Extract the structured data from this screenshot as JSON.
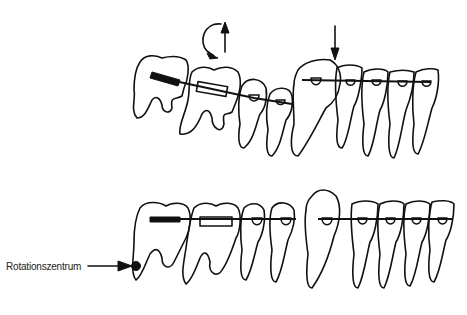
{
  "diagram": {
    "title": "",
    "panels": [
      {
        "id": "top",
        "description": "Lower dental arch with brackets and archwire; rotation and extrusion arrows above premolar/molar, downward arrow above canine"
      },
      {
        "id": "bottom",
        "description": "Lower dental arch after movement showing tipped molar around rotation center"
      }
    ],
    "annotations": {
      "rotation_center_label": "Rotationszentrum"
    },
    "colors": {
      "line": "#111111",
      "background": "#ffffff"
    }
  }
}
